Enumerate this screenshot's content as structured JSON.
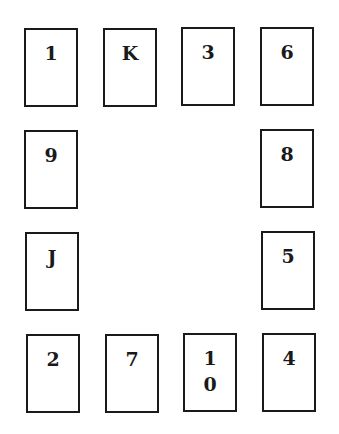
{
  "diagram": {
    "title": "",
    "cards": [
      {
        "id": "c1",
        "label": "1",
        "row": 1,
        "col": 1,
        "x": 24,
        "y": 28
      },
      {
        "id": "c2",
        "label": "K",
        "row": 1,
        "col": 2,
        "x": 103,
        "y": 28
      },
      {
        "id": "c3",
        "label": "3",
        "row": 1,
        "col": 3,
        "x": 181,
        "y": 27
      },
      {
        "id": "c4",
        "label": "6",
        "row": 1,
        "col": 4,
        "x": 260,
        "y": 27
      },
      {
        "id": "c5",
        "label": "9",
        "row": 2,
        "col": 1,
        "x": 24,
        "y": 130
      },
      {
        "id": "c6",
        "label": "8",
        "row": 2,
        "col": 4,
        "x": 260,
        "y": 129
      },
      {
        "id": "c7",
        "label": "J",
        "row": 3,
        "col": 1,
        "x": 25,
        "y": 232
      },
      {
        "id": "c8",
        "label": "5",
        "row": 3,
        "col": 4,
        "x": 261,
        "y": 231
      },
      {
        "id": "c9",
        "label": "2",
        "row": 4,
        "col": 1,
        "x": 26,
        "y": 334
      },
      {
        "id": "c10",
        "label": "7",
        "row": 4,
        "col": 2,
        "x": 105,
        "y": 334
      },
      {
        "id": "c11",
        "label": "1\n0",
        "row": 4,
        "col": 3,
        "x": 183,
        "y": 333
      },
      {
        "id": "c12",
        "label": "4",
        "row": 4,
        "col": 4,
        "x": 262,
        "y": 333
      }
    ],
    "colors": {
      "border": "#1a1a1a",
      "text": "#1a1a1a",
      "background": "#ffffff"
    }
  }
}
